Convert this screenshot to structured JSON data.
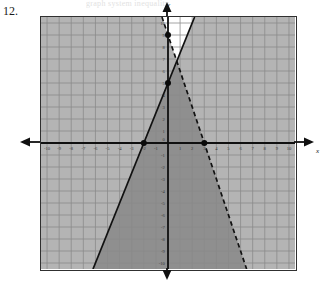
{
  "problem": {
    "number_label": "12.",
    "ghost_text": "graph  system  inequality"
  },
  "axes": {
    "x_name": "x",
    "y_name": "y",
    "x_min": -10.5,
    "x_max": 10.5,
    "y_min": -10.5,
    "y_max": 10.5,
    "grid_step": 1,
    "grid_color": "#8a8a8a",
    "axis_color": "#101010",
    "frame_color": "#303030",
    "x_tick_labels": [
      "-10",
      "-9",
      "-8",
      "-7",
      "-6",
      "-5",
      "-4",
      "-3",
      "-2",
      "-1",
      "1",
      "2",
      "3",
      "4",
      "5",
      "6",
      "7",
      "8",
      "9",
      "10"
    ],
    "y_tick_labels": [
      "10",
      "9",
      "8",
      "7",
      "6",
      "5",
      "4",
      "3",
      "2",
      "1",
      "0",
      "-1",
      "-2",
      "-3",
      "-4",
      "-5",
      "-6",
      "-7",
      "-8",
      "-9",
      "-10"
    ],
    "origin_label": "0",
    "tick_label_color": "#3a3a3a"
  },
  "chart_data": {
    "type": "line",
    "title": "",
    "xlabel": "x",
    "ylabel": "y",
    "xlim": [
      -10.5,
      10.5
    ],
    "ylim": [
      -10.5,
      10.5
    ],
    "grid": true,
    "legend": "none",
    "series": [
      {
        "name": "boundary-solid",
        "style": "solid",
        "slope": 2.5,
        "intercept": 5,
        "equation": "y = 2.5x + 5",
        "inequality": "y <= 2.5x + 5",
        "shade_side": "right-below",
        "x": [
          -6.2,
          2.2
        ],
        "y": [
          -10.5,
          10.5
        ],
        "color": "#111111"
      },
      {
        "name": "boundary-dashed",
        "style": "dashed",
        "slope": -3,
        "intercept": 9,
        "equation": "y = -3x + 9",
        "inequality": "y < -3x + 9",
        "shade_side": "left-below",
        "x": [
          -0.5,
          6.5
        ],
        "y": [
          10.5,
          -10.5
        ],
        "color": "#111111"
      }
    ],
    "points": [
      {
        "label": "y-intercept-dashed",
        "x": 0,
        "y": 9
      },
      {
        "label": "y-intercept-solid",
        "x": 0,
        "y": 5
      },
      {
        "label": "x-intercept-solid",
        "x": -2,
        "y": 0
      },
      {
        "label": "x-intercept-dashed",
        "x": 3,
        "y": 0
      }
    ],
    "shading": {
      "none_color": "#ffffff",
      "single_color": "#b4b4b4",
      "overlap_color": "#8f8f8f",
      "overlap_description": "wedge between the two boundary lines (solution region)"
    }
  }
}
